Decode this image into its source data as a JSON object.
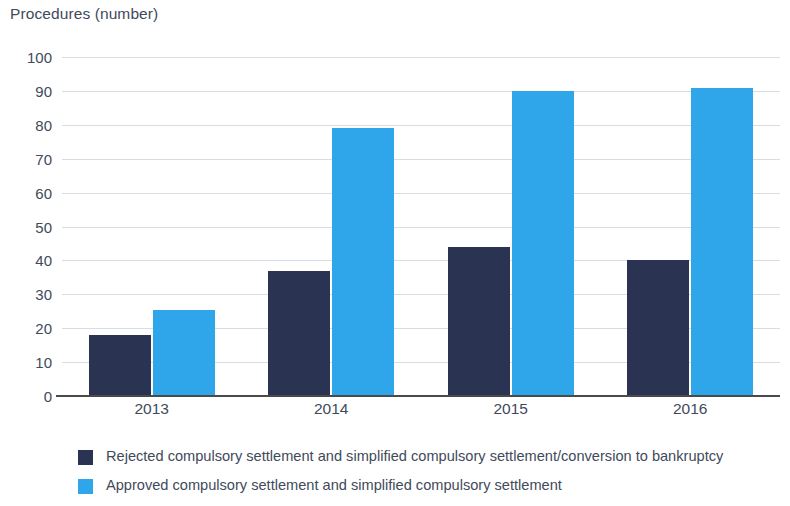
{
  "chart_data": {
    "type": "bar",
    "title": "Procedures (number)",
    "xlabel": "",
    "ylabel": "Procedures (number)",
    "categories": [
      "2013",
      "2014",
      "2015",
      "2016"
    ],
    "series": [
      {
        "name": "Rejected compulsory settlement and simplified compulsory settlement/conversion to bankruptcy",
        "color": "#2b3353",
        "values": [
          18,
          37,
          44,
          40
        ]
      },
      {
        "name": "Approved compulsory settlement and simplified compulsory settlement",
        "color": "#2fa6e9",
        "values": [
          25.5,
          79,
          90,
          91
        ]
      }
    ],
    "ylim": [
      0,
      100
    ],
    "ytick_step": 10,
    "yticks": [
      "100",
      "90",
      "80",
      "70",
      "60",
      "50",
      "40",
      "30",
      "20",
      "10",
      "0"
    ],
    "grid": true,
    "legend_position": "bottom-left"
  },
  "legend": {
    "items": [
      {
        "label": "Rejected compulsory settlement and simplified compulsory settlement/conversion to bankruptcy",
        "color": "#2b3353"
      },
      {
        "label": "Approved compulsory settlement and simplified compulsory settlement",
        "color": "#2fa6e9"
      }
    ]
  }
}
